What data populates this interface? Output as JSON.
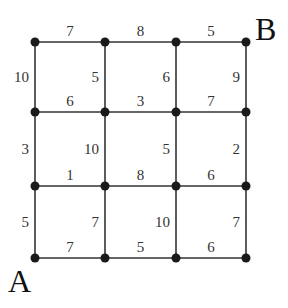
{
  "diagram": {
    "type": "weighted-grid-graph",
    "columns_x": [
      35,
      105,
      176,
      246
    ],
    "rows_y": [
      42,
      112,
      186,
      258
    ],
    "start_label": "A",
    "end_label": "B",
    "horizontal_edges": [
      {
        "row": 0,
        "col": 0,
        "weight": "7"
      },
      {
        "row": 0,
        "col": 1,
        "weight": "8"
      },
      {
        "row": 0,
        "col": 2,
        "weight": "5"
      },
      {
        "row": 1,
        "col": 0,
        "weight": "6"
      },
      {
        "row": 1,
        "col": 1,
        "weight": "3"
      },
      {
        "row": 1,
        "col": 2,
        "weight": "7"
      },
      {
        "row": 2,
        "col": 0,
        "weight": "1"
      },
      {
        "row": 2,
        "col": 1,
        "weight": "8"
      },
      {
        "row": 2,
        "col": 2,
        "weight": "6"
      },
      {
        "row": 3,
        "col": 0,
        "weight": "7"
      },
      {
        "row": 3,
        "col": 1,
        "weight": "5"
      },
      {
        "row": 3,
        "col": 2,
        "weight": "6"
      }
    ],
    "vertical_edges": [
      {
        "row": 0,
        "col": 0,
        "weight": "10"
      },
      {
        "row": 0,
        "col": 1,
        "weight": "5"
      },
      {
        "row": 0,
        "col": 2,
        "weight": "6"
      },
      {
        "row": 0,
        "col": 3,
        "weight": "9"
      },
      {
        "row": 1,
        "col": 0,
        "weight": "3"
      },
      {
        "row": 1,
        "col": 1,
        "weight": "10"
      },
      {
        "row": 1,
        "col": 2,
        "weight": "5"
      },
      {
        "row": 1,
        "col": 3,
        "weight": "2"
      },
      {
        "row": 2,
        "col": 0,
        "weight": "5"
      },
      {
        "row": 2,
        "col": 1,
        "weight": "7"
      },
      {
        "row": 2,
        "col": 2,
        "weight": "10"
      },
      {
        "row": 2,
        "col": 3,
        "weight": "7"
      }
    ]
  }
}
